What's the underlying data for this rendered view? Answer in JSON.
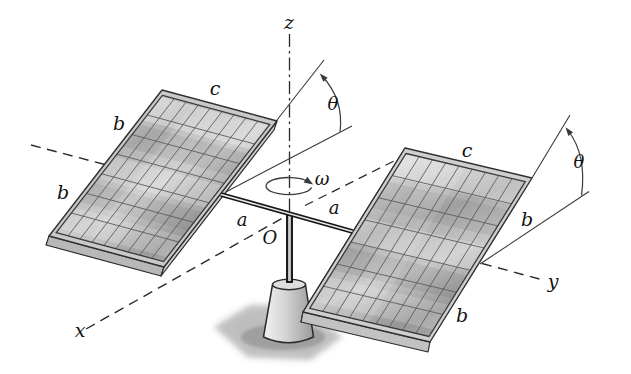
{
  "figure": {
    "background_color": "#ffffff",
    "line_color": "#2a2a2a",
    "panel_frame_color": "#c9c9c9",
    "pedestal_color": "#d8d8d8",
    "shadow_color": "#8f8f8f"
  },
  "labels": {
    "axis_z": "z",
    "axis_x": "x",
    "axis_y": "y",
    "origin": "O",
    "arm_left": "a",
    "arm_right": "a",
    "edge_c_left": "c",
    "edge_c_right": "c",
    "half_edge_b_left_upper": "b",
    "half_edge_b_left_lower": "b",
    "half_edge_b_right_upper": "b",
    "half_edge_b_right_lower": "b",
    "tilt_angle_left": "θ",
    "tilt_angle_right": "θ",
    "angular_velocity": "ω"
  },
  "panels": {
    "left": {
      "grid_rows": 7,
      "grid_cols": 9
    },
    "right": {
      "grid_rows": 7,
      "grid_cols": 9
    }
  }
}
